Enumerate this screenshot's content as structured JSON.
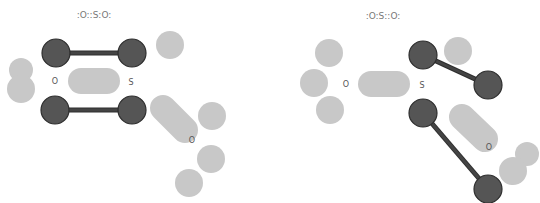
{
  "colors": {
    "atom": "#555555",
    "atom_stroke": "#2e2e2e",
    "bond": "#444444",
    "lone_pair": "#c8c8c8",
    "text": "#555555"
  },
  "diagrams": [
    {
      "name": "resonance-structure-1",
      "lewis": ":O::S:O:",
      "labels": [
        {
          "text": "O",
          "x": 55,
          "y": 84
        },
        {
          "text": "S",
          "x": 131,
          "y": 85
        },
        {
          "text": "O",
          "x": 192,
          "y": 143
        }
      ],
      "atoms": [
        {
          "x": 56,
          "y": 53
        },
        {
          "x": 132,
          "y": 53
        },
        {
          "x": 55,
          "y": 110
        },
        {
          "x": 132,
          "y": 110
        }
      ],
      "bonds": [
        {
          "x1": 56,
          "y1": 53,
          "x2": 132,
          "y2": 53
        },
        {
          "x1": 55,
          "y1": 110,
          "x2": 132,
          "y2": 110
        }
      ],
      "lone_pairs": [
        {
          "x": 170,
          "y": 45,
          "r": 14
        },
        {
          "x": 21,
          "y": 70,
          "r": 12
        },
        {
          "x": 21,
          "y": 89,
          "r": 14
        },
        {
          "x": 212,
          "y": 116,
          "r": 14
        },
        {
          "x": 211,
          "y": 159,
          "r": 14
        },
        {
          "x": 189,
          "y": 183,
          "r": 14
        }
      ],
      "bond_lobes": [
        {
          "x1": 81,
          "y1": 81,
          "x2": 107,
          "y2": 81
        },
        {
          "x1": 163,
          "y1": 108,
          "x2": 185,
          "y2": 130
        }
      ]
    },
    {
      "name": "resonance-structure-2",
      "lewis": ":O:S::O:",
      "labels": [
        {
          "text": "O",
          "x": 346,
          "y": 87
        },
        {
          "text": "S",
          "x": 422,
          "y": 88
        },
        {
          "text": "O",
          "x": 489,
          "y": 150
        }
      ],
      "atoms": [
        {
          "x": 423,
          "y": 55
        },
        {
          "x": 488,
          "y": 85
        },
        {
          "x": 423,
          "y": 113
        },
        {
          "x": 488,
          "y": 189
        }
      ],
      "bonds": [
        {
          "x1": 423,
          "y1": 55,
          "x2": 488,
          "y2": 85
        },
        {
          "x1": 423,
          "y1": 113,
          "x2": 488,
          "y2": 189
        }
      ],
      "lone_pairs": [
        {
          "x": 329,
          "y": 53,
          "r": 14
        },
        {
          "x": 314,
          "y": 83,
          "r": 14
        },
        {
          "x": 330,
          "y": 110,
          "r": 14
        },
        {
          "x": 458,
          "y": 51,
          "r": 14
        },
        {
          "x": 527,
          "y": 154,
          "r": 12
        },
        {
          "x": 513,
          "y": 171,
          "r": 14
        }
      ],
      "bond_lobes": [
        {
          "x1": 371,
          "y1": 84,
          "x2": 397,
          "y2": 84
        },
        {
          "x1": 462,
          "y1": 117,
          "x2": 485,
          "y2": 139
        }
      ]
    }
  ]
}
